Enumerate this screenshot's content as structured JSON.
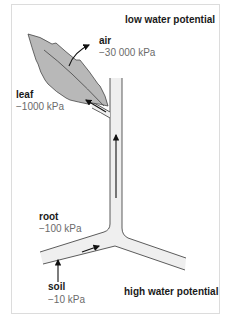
{
  "header": {
    "low_label": "low water potential"
  },
  "footer": {
    "high_label": "high water potential"
  },
  "labels": {
    "air": {
      "name": "air",
      "value": "−30 000 kPa"
    },
    "leaf": {
      "name": "leaf",
      "value": "−1000 kPa"
    },
    "root": {
      "name": "root",
      "value": "−100 kPa"
    },
    "soil": {
      "name": "soil",
      "value": "−10 kPa"
    }
  },
  "colors": {
    "leaf_fill": "#b8b8b8",
    "tube_fill": "#efefef",
    "outline": "#333333",
    "arrow": "#111111",
    "value_text": "#6b6b6b"
  }
}
